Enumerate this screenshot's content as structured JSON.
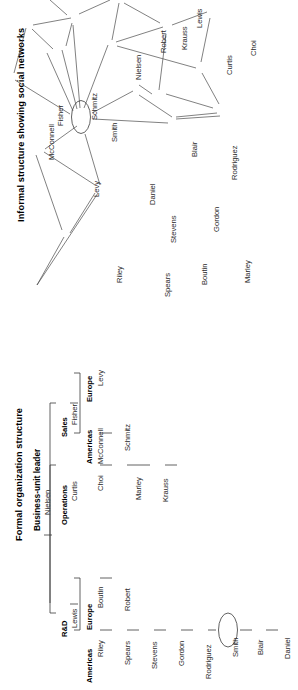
{
  "figure": {
    "orientation": "rotated-90-ccw",
    "panels": [
      "formal-organization-structure",
      "informal-social-network"
    ]
  },
  "org_chart": {
    "title": "Formal organization structure",
    "root_label": "Business-unit leader",
    "root_name": "Nielsen",
    "divisions": [
      {
        "label": "R&D",
        "leader": "Lewis",
        "regions": [
          {
            "label": "Americas",
            "head": "Riley",
            "members": [
              "Spears",
              "Stevens",
              "Gordon",
              "Rodriguez",
              "Smith",
              "Blair",
              "Daniel"
            ]
          },
          {
            "label": "Europe",
            "head": "Boutin",
            "members": [
              "Robert"
            ]
          }
        ]
      },
      {
        "label": "Operations",
        "leader": "Curtis",
        "regions": [
          {
            "label": "",
            "head": "Choi",
            "members": [
              "Marley",
              "Krauss"
            ]
          }
        ]
      },
      {
        "label": "Sales",
        "leader": "Fisher",
        "regions": [
          {
            "label": "Americas",
            "head": "McConnell",
            "members": [
              "Schmitz"
            ]
          },
          {
            "label": "Europe",
            "head": "Levy",
            "members": []
          }
        ]
      }
    ],
    "highlighted_node": "Smith"
  },
  "network": {
    "title": "Informal structure showing social networks",
    "highlighted_node": "Smith",
    "nodes": [
      {
        "id": "McConnell",
        "label": "McConnell"
      },
      {
        "id": "Fisher",
        "label": "Fisher"
      },
      {
        "id": "Schmitz",
        "label": "Schmitz"
      },
      {
        "id": "Levy",
        "label": "Levy"
      },
      {
        "id": "Smith",
        "label": "Smith"
      },
      {
        "id": "Nielsen",
        "label": "Nielsen"
      },
      {
        "id": "Lewis",
        "label": "Lewis"
      },
      {
        "id": "Robert",
        "label": "Robert"
      },
      {
        "id": "Krauss",
        "label": "Krauss"
      },
      {
        "id": "Curtis",
        "label": "Curtis"
      },
      {
        "id": "Choi",
        "label": "Choi"
      },
      {
        "id": "Rodriguez",
        "label": "Rodriguez"
      },
      {
        "id": "Blair",
        "label": "Blair"
      },
      {
        "id": "Gordon",
        "label": "Gordon"
      },
      {
        "id": "Marley",
        "label": "Marley"
      },
      {
        "id": "Boutin",
        "label": "Boutin"
      },
      {
        "id": "Stevens",
        "label": "Stevens"
      },
      {
        "id": "Spears",
        "label": "Spears"
      },
      {
        "id": "Riley",
        "label": "Riley"
      },
      {
        "id": "Daniel",
        "label": "Daniel"
      }
    ],
    "edges": [
      [
        "McConnell",
        "Fisher"
      ],
      [
        "McConnell",
        "Levy"
      ],
      [
        "Fisher",
        "Schmitz"
      ],
      [
        "Fisher",
        "Levy"
      ],
      [
        "Schmitz",
        "Levy"
      ],
      [
        "Schmitz",
        "Smith"
      ],
      [
        "Levy",
        "Smith"
      ],
      [
        "Smith",
        "Nielsen"
      ],
      [
        "Smith",
        "Robert"
      ],
      [
        "Smith",
        "Krauss"
      ],
      [
        "Smith",
        "Curtis"
      ],
      [
        "Smith",
        "Blair"
      ],
      [
        "Smith",
        "Daniel"
      ],
      [
        "Smith",
        "Riley"
      ],
      [
        "Nielsen",
        "Lewis"
      ],
      [
        "Lewis",
        "Robert"
      ],
      [
        "Lewis",
        "Curtis"
      ],
      [
        "Krauss",
        "Curtis"
      ],
      [
        "Curtis",
        "Choi"
      ],
      [
        "Curtis",
        "Rodriguez"
      ],
      [
        "Blair",
        "Rodriguez"
      ],
      [
        "Blair",
        "Gordon"
      ],
      [
        "Blair",
        "Boutin"
      ],
      [
        "Gordon",
        "Rodriguez"
      ],
      [
        "Gordon",
        "Marley"
      ],
      [
        "Gordon",
        "Stevens"
      ],
      [
        "Boutin",
        "Marley"
      ],
      [
        "Boutin",
        "Spears"
      ],
      [
        "Stevens",
        "Spears"
      ],
      [
        "Stevens",
        "Daniel"
      ],
      [
        "Riley",
        "Spears"
      ],
      [
        "Riley",
        "Daniel"
      ]
    ]
  }
}
